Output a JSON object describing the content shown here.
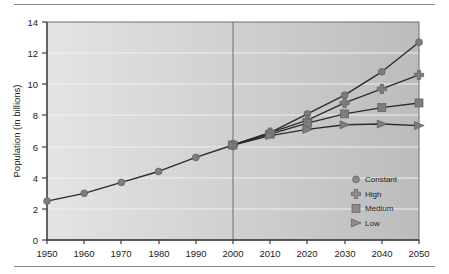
{
  "figure": {
    "name": "world-population-projections-chart",
    "has_top_rule": true,
    "has_bottom_rule": true
  },
  "chart_data": {
    "type": "line",
    "title": "",
    "xlabel": "",
    "ylabel": "Population (in billions)",
    "x": [
      1950,
      1960,
      1970,
      1980,
      1990,
      2000,
      2010,
      2020,
      2030,
      2040,
      2050
    ],
    "xticklabels": [
      "1950",
      "1960",
      "1970",
      "1980",
      "1990",
      "2000",
      "2010",
      "2020",
      "2030",
      "2040",
      "2050"
    ],
    "yticks": [
      0,
      2,
      4,
      6,
      8,
      10,
      12,
      14
    ],
    "yticklabels": [
      "0",
      "2",
      "4",
      "6",
      "8",
      "10",
      "12",
      "14"
    ],
    "xlim": [
      1950,
      2050
    ],
    "ylim": [
      0,
      14
    ],
    "grid": true,
    "grid_orientation": "horizontal",
    "legend_position": "lower right",
    "annotations": [
      {
        "type": "vline",
        "x": 2000,
        "label": "present-divider"
      }
    ],
    "series": [
      {
        "name": "Constant",
        "marker": "circle",
        "color": "#7d7d7d",
        "x": [
          1950,
          1960,
          1970,
          1980,
          1990,
          2000,
          2010,
          2020,
          2030,
          2040,
          2050
        ],
        "values": [
          2.5,
          3.0,
          3.7,
          4.4,
          5.3,
          6.1,
          6.9,
          8.1,
          9.3,
          10.8,
          12.7
        ]
      },
      {
        "name": "High",
        "marker": "cross",
        "color": "#7d7d7d",
        "x": [
          2000,
          2010,
          2020,
          2030,
          2040,
          2050
        ],
        "values": [
          6.1,
          6.9,
          7.7,
          8.8,
          9.7,
          10.6
        ]
      },
      {
        "name": "Medium",
        "marker": "square",
        "color": "#7d7d7d",
        "x": [
          2000,
          2010,
          2020,
          2030,
          2040,
          2050
        ],
        "values": [
          6.1,
          6.8,
          7.5,
          8.1,
          8.5,
          8.8
        ]
      },
      {
        "name": "Low",
        "marker": "triangle",
        "color": "#7d7d7d",
        "x": [
          2000,
          2010,
          2020,
          2030,
          2040,
          2050
        ],
        "values": [
          6.1,
          6.7,
          7.1,
          7.4,
          7.45,
          7.35
        ]
      }
    ]
  },
  "legend": {
    "items": [
      {
        "label": "Constant",
        "marker": "circle"
      },
      {
        "label": "High",
        "marker": "cross"
      },
      {
        "label": "Medium",
        "marker": "square"
      },
      {
        "label": "Low",
        "marker": "triangle"
      }
    ]
  },
  "colors": {
    "plot_bg_left": "#e2e2e2",
    "plot_bg_right": "#bdbdbd",
    "line": "#2b2b2b",
    "marker": "#8c8c8c",
    "axis": "#4a4a4a",
    "gridline": "#efefef",
    "text": "#1c1c1c",
    "rule": "#8a8a8a"
  }
}
